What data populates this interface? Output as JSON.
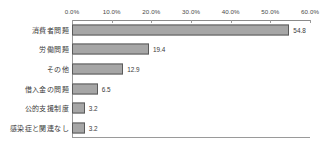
{
  "chart_data": {
    "type": "bar",
    "orientation": "horizontal",
    "title": "",
    "subtitle": "",
    "xlabel": "",
    "ylabel": "",
    "xlim": [
      0,
      60
    ],
    "grid": false,
    "legend": null,
    "axis_position": "top",
    "tick_labels": [
      "0.0%",
      "10.0%",
      "20.0%",
      "30.0%",
      "40.0%",
      "50.0%",
      "60.0%"
    ],
    "tick_values": [
      0,
      10,
      20,
      30,
      40,
      50,
      60
    ],
    "categories": [
      "消費者問題",
      "労働問題",
      "その他",
      "借入金の問題",
      "公的支援制度",
      "感染症と関連なし"
    ],
    "values": [
      54.8,
      19.4,
      12.9,
      6.5,
      3.2,
      3.2
    ],
    "value_labels": [
      "54.8",
      "19.4",
      "12.9",
      "6.5",
      "3.2",
      "3.2"
    ],
    "colors": {
      "bar_fill": "#a6a6a6",
      "bar_border": "#5a5a5a",
      "axis": "#9a9a9a",
      "text": "#3a3a3a",
      "background": "#ffffff"
    }
  }
}
